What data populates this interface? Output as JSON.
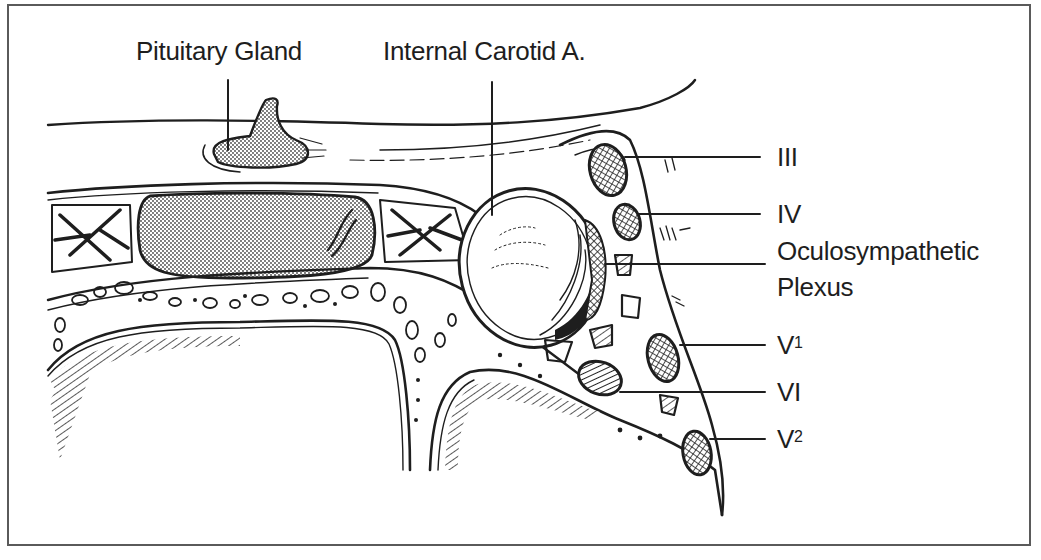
{
  "figure": {
    "border_color": "#5a5a5a",
    "ink_color": "#1e1e1e",
    "stipple_fill": "#b8b8b8"
  },
  "labels": {
    "pituitary": "Pituitary Gland",
    "carotid": "Internal Carotid A.",
    "cn3": "III",
    "cn4": "IV",
    "oculo_line1": "Oculosympathetic",
    "oculo_line2": "Plexus",
    "v1_base": "V",
    "v1_sup": "1",
    "cn6": "VI",
    "v2_base": "V",
    "v2_sup": "2"
  }
}
